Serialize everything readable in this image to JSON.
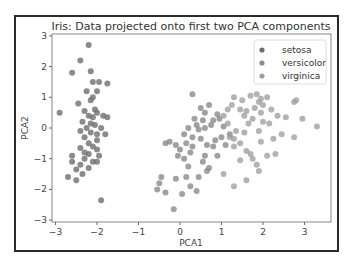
{
  "chart_data": {
    "type": "scatter",
    "title": "Iris: Data projected onto first two PCA components",
    "xlabel": "PCA1",
    "ylabel": "PCA2",
    "xlim": [
      -3.1,
      3.6
    ],
    "ylim": [
      -3,
      3
    ],
    "xticks": [
      -3,
      -2,
      -1,
      0,
      1,
      2,
      3
    ],
    "yticks": [
      -3,
      -2,
      -1,
      0,
      1,
      2,
      3
    ],
    "xtick_labels": [
      "−3",
      "−2",
      "−1",
      "0",
      "1",
      "2",
      "3"
    ],
    "ytick_labels": [
      "−3",
      "−2",
      "−1",
      "0",
      "1",
      "2",
      "3"
    ],
    "grid": false,
    "legend": {
      "position": "top-right",
      "entries": [
        "setosa",
        "versicolor",
        "virginica"
      ]
    },
    "series": [
      {
        "name": "setosa",
        "color": "#6e6e6e",
        "points": [
          [
            -2.2,
            2.7
          ],
          [
            -2.4,
            2.2
          ],
          [
            -2.6,
            1.8
          ],
          [
            -2.15,
            1.85
          ],
          [
            -2.1,
            1.5
          ],
          [
            -1.95,
            1.5
          ],
          [
            -1.75,
            1.45
          ],
          [
            -2.25,
            1.2
          ],
          [
            -2.0,
            1.2
          ],
          [
            -2.1,
            1.0
          ],
          [
            -2.15,
            0.9
          ],
          [
            -2.3,
            0.55
          ],
          [
            -2.05,
            0.6
          ],
          [
            -2.0,
            0.5
          ],
          [
            -2.2,
            0.4
          ],
          [
            -2.1,
            0.35
          ],
          [
            -2.9,
            0.5
          ],
          [
            -1.85,
            0.4
          ],
          [
            -1.75,
            0.35
          ],
          [
            -2.35,
            0.2
          ],
          [
            -2.15,
            0.15
          ],
          [
            -2.05,
            0.1
          ],
          [
            -2.25,
            0.0
          ],
          [
            -2.4,
            -0.1
          ],
          [
            -1.9,
            0.0
          ],
          [
            -2.0,
            -0.2
          ],
          [
            -2.3,
            -0.3
          ],
          [
            -1.8,
            -0.2
          ],
          [
            -2.2,
            -0.5
          ],
          [
            -2.4,
            -0.65
          ],
          [
            -2.1,
            -0.6
          ],
          [
            -2.0,
            -0.7
          ],
          [
            -2.2,
            -0.85
          ],
          [
            -1.95,
            -0.9
          ],
          [
            -2.6,
            -0.9
          ],
          [
            -2.3,
            -1.0
          ],
          [
            -2.1,
            -1.1
          ],
          [
            -2.0,
            -1.1
          ],
          [
            -2.5,
            -1.35
          ],
          [
            -2.35,
            -1.5
          ],
          [
            -2.7,
            -1.6
          ],
          [
            -2.6,
            -1.1
          ],
          [
            -2.4,
            -1.2
          ],
          [
            -2.2,
            -1.3
          ],
          [
            -2.0,
            -0.4
          ],
          [
            -2.45,
            0.8
          ],
          [
            -2.5,
            -1.7
          ],
          [
            -2.3,
            -0.8
          ],
          [
            -1.9,
            -2.35
          ],
          [
            -2.15,
            -0.15
          ]
        ]
      },
      {
        "name": "versicolor",
        "color": "#8a8a8a",
        "points": [
          [
            0.3,
            1.1
          ],
          [
            0.5,
            0.65
          ],
          [
            0.6,
            0.5
          ],
          [
            0.55,
            0.25
          ],
          [
            0.7,
            0.75
          ],
          [
            0.9,
            0.45
          ],
          [
            0.2,
            0.0
          ],
          [
            0.4,
            0.1
          ],
          [
            0.6,
            0.0
          ],
          [
            0.8,
            0.25
          ],
          [
            0.3,
            -0.3
          ],
          [
            0.5,
            -0.35
          ],
          [
            0.15,
            -0.5
          ],
          [
            -0.1,
            -0.55
          ],
          [
            0.0,
            -0.7
          ],
          [
            0.3,
            -0.6
          ],
          [
            -0.25,
            -0.45
          ],
          [
            -0.35,
            -0.5
          ],
          [
            -0.05,
            -0.9
          ],
          [
            0.1,
            -1.0
          ],
          [
            0.2,
            -1.25
          ],
          [
            0.15,
            -1.6
          ],
          [
            -0.1,
            -1.65
          ],
          [
            -0.5,
            -1.8
          ],
          [
            -0.55,
            -2.0
          ],
          [
            -0.35,
            -2.1
          ],
          [
            0.4,
            -2.05
          ],
          [
            0.45,
            -1.6
          ],
          [
            0.65,
            -1.4
          ],
          [
            -0.45,
            -1.6
          ],
          [
            0.25,
            -1.9
          ],
          [
            0.05,
            -2.15
          ],
          [
            -0.15,
            -2.65
          ],
          [
            0.7,
            -1.3
          ],
          [
            0.8,
            -0.6
          ],
          [
            0.9,
            -0.9
          ],
          [
            1.0,
            -0.3
          ],
          [
            1.1,
            -0.55
          ],
          [
            1.2,
            -0.2
          ],
          [
            0.35,
            0.3
          ],
          [
            0.95,
            0.3
          ],
          [
            0.6,
            -0.9
          ],
          [
            0.85,
            -0.4
          ],
          [
            0.1,
            -0.2
          ],
          [
            1.05,
            0.05
          ],
          [
            0.45,
            -0.05
          ],
          [
            0.75,
            0.1
          ],
          [
            0.25,
            -0.8
          ],
          [
            0.55,
            -1.1
          ],
          [
            0.65,
            -0.55
          ]
        ]
      },
      {
        "name": "virginica",
        "color": "#a0a0a0",
        "points": [
          [
            1.3,
            1.0
          ],
          [
            1.5,
            0.9
          ],
          [
            1.7,
            1.05
          ],
          [
            1.85,
            1.1
          ],
          [
            1.95,
            0.95
          ],
          [
            2.1,
            1.0
          ],
          [
            2.0,
            0.75
          ],
          [
            1.9,
            0.85
          ],
          [
            2.2,
            0.6
          ],
          [
            2.35,
            0.4
          ],
          [
            2.55,
            0.35
          ],
          [
            2.8,
            0.9
          ],
          [
            2.75,
            0.85
          ],
          [
            2.95,
            0.3
          ],
          [
            3.3,
            0.05
          ],
          [
            1.45,
            0.6
          ],
          [
            1.6,
            0.55
          ],
          [
            1.25,
            0.75
          ],
          [
            1.15,
            0.6
          ],
          [
            1.05,
            0.4
          ],
          [
            1.55,
            0.4
          ],
          [
            1.75,
            0.3
          ],
          [
            1.95,
            0.5
          ],
          [
            1.65,
            0.15
          ],
          [
            1.9,
            -0.1
          ],
          [
            1.35,
            -0.1
          ],
          [
            1.55,
            -0.15
          ],
          [
            1.2,
            -0.3
          ],
          [
            1.45,
            -0.5
          ],
          [
            1.3,
            -0.6
          ],
          [
            1.7,
            -0.85
          ],
          [
            1.75,
            -1.0
          ],
          [
            1.85,
            -1.2
          ],
          [
            1.6,
            -0.75
          ],
          [
            1.95,
            -0.45
          ],
          [
            2.25,
            -0.35
          ],
          [
            2.75,
            -0.3
          ],
          [
            2.1,
            -0.9
          ],
          [
            1.45,
            -1.05
          ],
          [
            1.3,
            -0.35
          ],
          [
            2.0,
            0.2
          ],
          [
            2.15,
            0.15
          ],
          [
            1.05,
            -1.5
          ],
          [
            1.3,
            -1.9
          ],
          [
            1.9,
            -1.4
          ],
          [
            2.3,
            -0.85
          ],
          [
            1.8,
            0.65
          ],
          [
            1.15,
            0.15
          ],
          [
            2.45,
            -0.2
          ],
          [
            1.6,
            -1.7
          ]
        ]
      }
    ]
  }
}
